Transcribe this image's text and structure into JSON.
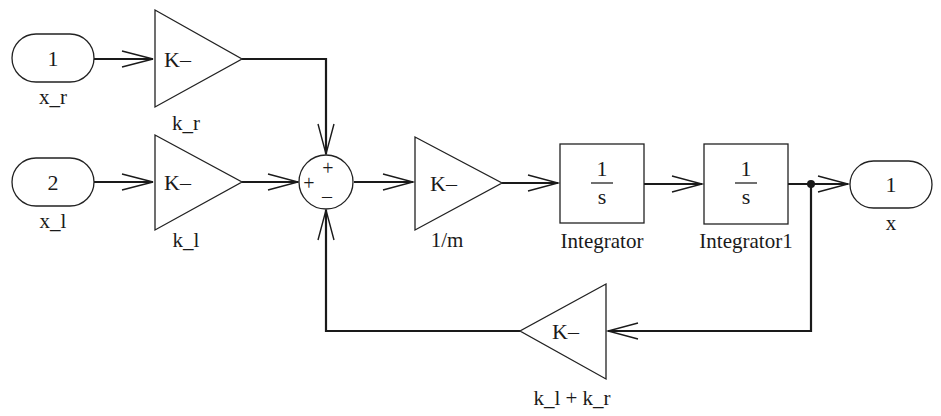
{
  "diagram": {
    "type": "simulink-block-diagram",
    "colors": {
      "line": "#1a1a1a",
      "background": "#ffffff"
    },
    "blocks": {
      "inport_xr": {
        "number": "1",
        "name": "x_r"
      },
      "inport_xl": {
        "number": "2",
        "name": "x_l"
      },
      "gain_kr": {
        "content": "K–",
        "name": "k_r"
      },
      "gain_kl": {
        "content": "K–",
        "name": "k_l"
      },
      "sum": {
        "signs": {
          "top": "+",
          "left": "+",
          "bottom": "–"
        }
      },
      "gain_m": {
        "content": "K–",
        "name": "1/m"
      },
      "integrator": {
        "num": "1",
        "den": "s",
        "name": "Integrator"
      },
      "integrator1": {
        "num": "1",
        "den": "s",
        "name": "Integrator1"
      },
      "outport_x": {
        "number": "1",
        "name": "x"
      },
      "gain_fb": {
        "content": "K–",
        "name": "k_l + k_r"
      }
    },
    "connections": [
      {
        "from": "x_r",
        "to": "k_r"
      },
      {
        "from": "x_l",
        "to": "k_l"
      },
      {
        "from": "k_r",
        "to": "sum",
        "port": "top (+)"
      },
      {
        "from": "k_l",
        "to": "sum",
        "port": "left (+)"
      },
      {
        "from": "k_l + k_r",
        "to": "sum",
        "port": "bottom (–)"
      },
      {
        "from": "sum",
        "to": "1/m"
      },
      {
        "from": "1/m",
        "to": "Integrator"
      },
      {
        "from": "Integrator",
        "to": "Integrator1"
      },
      {
        "from": "Integrator1",
        "to": "x"
      },
      {
        "from": "Integrator1",
        "to": "k_l + k_r",
        "note": "branch point feedback"
      }
    ]
  }
}
